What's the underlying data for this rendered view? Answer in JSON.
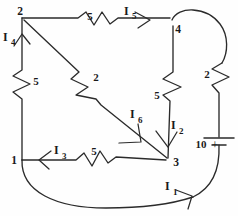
{
  "figure": {
    "kind": "hand-drawn-circuit-schematic",
    "background_color": "#fefefe",
    "ink_color": "#2b2b2b"
  },
  "nodes": [
    {
      "id": "n2",
      "label": "2",
      "x": 22,
      "y": 18
    },
    {
      "id": "n4",
      "label": "4",
      "x": 173,
      "y": 25
    },
    {
      "id": "n1",
      "label": "1",
      "x": 22,
      "y": 160
    },
    {
      "id": "n3",
      "label": "3",
      "x": 168,
      "y": 160
    }
  ],
  "node_labels": {
    "top_left": "2",
    "top_right": "4",
    "bottom_left": "1",
    "bottom_right": "3"
  },
  "resistors": [
    {
      "id": "r-top",
      "value": "5",
      "label_x": 90,
      "label_y": 20,
      "orientation": "horizontal"
    },
    {
      "id": "r-left",
      "value": "5",
      "label_x": 34,
      "label_y": 83,
      "orientation": "vertical"
    },
    {
      "id": "r-diagonal",
      "value": "2",
      "label_x": 95,
      "label_y": 81,
      "orientation": "diagonal"
    },
    {
      "id": "r-middle",
      "value": "5",
      "label_x": 155,
      "label_y": 97,
      "orientation": "vertical"
    },
    {
      "id": "r-right",
      "value": "2",
      "label_x": 206,
      "label_y": 77,
      "orientation": "vertical"
    },
    {
      "id": "r-bottom",
      "value": "5",
      "label_x": 92,
      "label_y": 155,
      "orientation": "horizontal"
    }
  ],
  "currents": [
    {
      "id": "I1",
      "symbol": "I",
      "subscript": "1",
      "label_x": 166,
      "label_y": 189,
      "direction": "up-right-along-bottom-arc"
    },
    {
      "id": "I2",
      "symbol": "I",
      "subscript": "2",
      "label_x": 172,
      "label_y": 128,
      "direction": "down"
    },
    {
      "id": "I3",
      "symbol": "I",
      "subscript": "3",
      "label_x": 55,
      "label_y": 153,
      "direction": "left"
    },
    {
      "id": "I4",
      "symbol": "I",
      "subscript": "4",
      "label_x": 3,
      "label_y": 40,
      "direction": "up"
    },
    {
      "id": "I5",
      "symbol": "I",
      "subscript": "5",
      "label_x": 123,
      "label_y": 14,
      "direction": "right"
    },
    {
      "id": "I6",
      "symbol": "I",
      "subscript": "6",
      "label_x": 131,
      "label_y": 117,
      "direction": "down-right-along-diagonal"
    }
  ],
  "source": {
    "id": "battery",
    "value": "10",
    "value_x": 200,
    "value_y": 146,
    "polarity": "+",
    "polarity_x": 217,
    "polarity_y": 147,
    "long_plate_y": 138,
    "short_plate_y": 145
  },
  "geometry": {
    "top_wire": "M22,18 L78,18 L86,13 L94,25 L102,13 L110,22 L118,18 L170,18",
    "left_wire": "M22,18 L22,70 L13,76 L30,84 L13,92 L22,99 L22,160",
    "bottom_wire": "M22,160 L76,160 L84,154 L92,165 L100,152 L108,162 L116,157 L165,160",
    "diagonal_wire": "M25,21 L78,72 L72,80 L88,88 L77,96 L95,100 L100,106 L168,158",
    "middle_wire": "M173,28 L173,72 L164,79 L181,87 L164,95 L170,101 L168,158",
    "right_arc": "M173,22 C178,8 205,8 219,24 C228,35 228,52 222,62",
    "right_wire": "M222,62 L213,69 L229,77 L213,85 L219,92 L219,138",
    "battery_lead_bottom": "M219,145 C219,172 208,190 185,198",
    "bottom_arc": "M22,160 C22,196 60,208 108,208 C150,208 180,200 192,190"
  }
}
